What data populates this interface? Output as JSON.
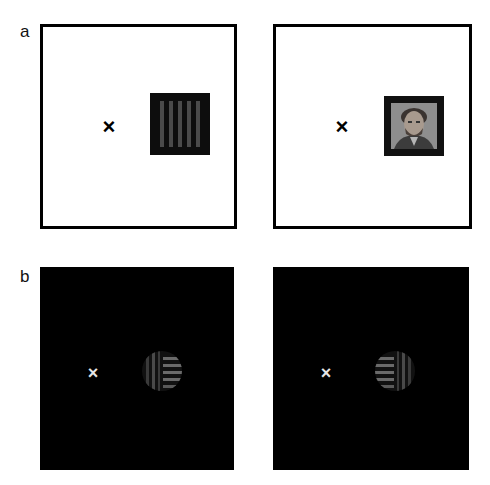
{
  "figure": {
    "panels": [
      {
        "label": "a",
        "background": "white",
        "frames": [
          {
            "fixation": "×",
            "stimulus": "vertical-grating-square",
            "stimulus_description": "dark square with vertical gray stripes"
          },
          {
            "fixation": "×",
            "stimulus": "face-photo-square",
            "stimulus_description": "grayscale face photo in dark square frame"
          }
        ]
      },
      {
        "label": "b",
        "background": "black",
        "frames": [
          {
            "fixation": "×",
            "stimulus": "split-disc-left-vertical-right-horizontal",
            "stimulus_description": "disc: left half vertical stripes, right half horizontal stripes"
          },
          {
            "fixation": "×",
            "stimulus": "split-disc-left-horizontal-right-vertical",
            "stimulus_description": "disc: left half horizontal stripes, right half vertical stripes"
          }
        ]
      }
    ],
    "colors": {
      "frame_border": "#000000",
      "white_bg": "#ffffff",
      "black_bg": "#000000",
      "stripe": "#5a5a5a",
      "fixation_dark": "#000000",
      "fixation_light": "#e6e6e6"
    }
  }
}
